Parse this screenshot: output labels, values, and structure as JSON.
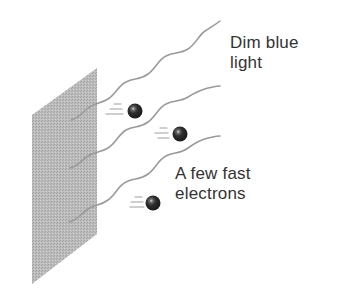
{
  "diagram": {
    "type": "photoelectric-effect-illustration",
    "labels": {
      "light": {
        "line1": "Dim blue",
        "line2": "light"
      },
      "electrons": {
        "line1": "A few fast",
        "line2": "electrons"
      }
    },
    "elements": {
      "metal_plate": {
        "shape": "parallelogram",
        "color": "#b3b3b3"
      },
      "light_waves": {
        "count": 3,
        "color": "#9a9a9a"
      },
      "electrons": {
        "count": 3,
        "color": "#2a2a2a",
        "motion": "fast"
      }
    },
    "colors": {
      "text": "#333333",
      "plate": "#b3b3b3",
      "wave": "#9a9a9a",
      "electron": "#2a2a2a",
      "speed_lines": "#a0a0a0"
    }
  }
}
